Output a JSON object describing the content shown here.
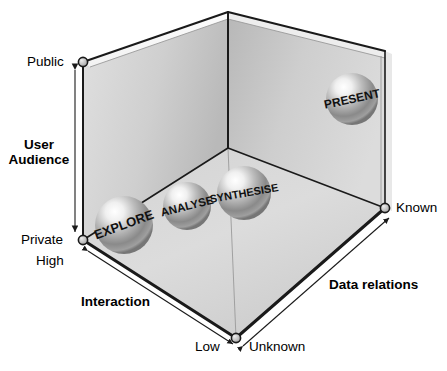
{
  "diagram": {
    "type": "3d-cube-scatter",
    "axes": [
      {
        "name": "User Audience",
        "label": "User\nAudience",
        "label_line1": "User",
        "label_line2": "Audience",
        "orientation": "vertical-left",
        "low_end": "Private",
        "high_end": "Public"
      },
      {
        "name": "Interaction",
        "label": "Interaction",
        "orientation": "depth-lower-left",
        "low_end": "Low",
        "high_end": "High"
      },
      {
        "name": "Data relations",
        "label": "Data relations",
        "orientation": "depth-lower-right",
        "low_end": "Unknown",
        "high_end": "Known"
      }
    ],
    "tick_labels": {
      "public": "Public",
      "private": "Private",
      "high": "High",
      "low": "Low",
      "unknown": "Unknown",
      "known": "Known"
    },
    "axis_titles": {
      "user_audience_line1": "User",
      "user_audience_line2": "Audience",
      "interaction": "Interaction",
      "data_relations": "Data relations"
    },
    "spheres": [
      {
        "label": "EXPLORE",
        "audience": "Private",
        "interaction": "High",
        "data_relations": "Unknown",
        "cx": 124,
        "cy": 225,
        "r": 29,
        "rotate": -20,
        "font_size": 13
      },
      {
        "label": "ANALYSE",
        "audience": "Private",
        "interaction": "Medium",
        "data_relations": "Medium",
        "cx": 187,
        "cy": 206,
        "r": 24,
        "rotate": -14,
        "font_size": 11.5
      },
      {
        "label": "SYNTHESISE",
        "audience": "Private",
        "interaction": "Medium-low",
        "data_relations": "Medium-high",
        "cx": 244,
        "cy": 193,
        "r": 27,
        "rotate": -10,
        "font_size": 11
      },
      {
        "label": "PRESENT",
        "audience": "Public",
        "interaction": "Low",
        "data_relations": "Known",
        "cx": 352,
        "cy": 99,
        "r": 26,
        "rotate": -12,
        "font_size": 12
      }
    ],
    "colors": {
      "wall_light": "#d8d8d8",
      "wall_dark": "#bdbdbd",
      "floor_light": "#e3e3e3",
      "floor_dark": "#c4c4c4",
      "edge": "#1a1a1a",
      "thin_edge": "#8a8a8a",
      "sphere_highlight": "#ffffff",
      "sphere_mid": "#b0b0b0",
      "sphere_dark": "#5a5a5a",
      "text": "#000000"
    },
    "markers": {
      "style": "open-circle",
      "fill": "#b9b9b9",
      "stroke": "#1a1a1a",
      "radius": 4.5
    }
  }
}
